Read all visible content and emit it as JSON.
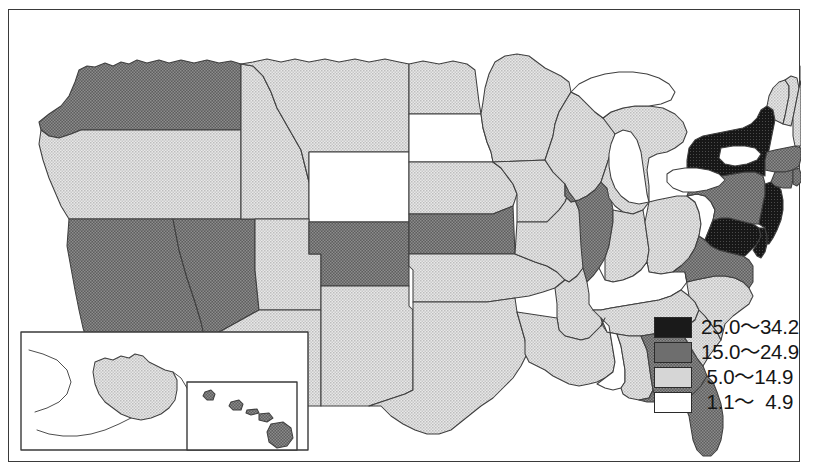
{
  "figure": {
    "type": "choropleth-map",
    "region": "United States"
  },
  "legend": {
    "title": "",
    "classes": [
      {
        "id": "class1",
        "label": "25.0〜34.2",
        "min": 25.0,
        "max": 34.2,
        "fill": "#1a1a1a",
        "swatch_name": "legend-swatch-darkest"
      },
      {
        "id": "class2",
        "label": "15.0〜24.9",
        "min": 15.0,
        "max": 24.9,
        "fill": "#6e6e6e",
        "swatch_name": "legend-swatch-dark"
      },
      {
        "id": "class3",
        "label": " 5.0〜14.9",
        "min": 5.0,
        "max": 14.9,
        "fill": "#d6d6d6",
        "swatch_name": "legend-swatch-light"
      },
      {
        "id": "class4",
        "label": " 1.1〜  4.9",
        "min": 1.1,
        "max": 4.9,
        "fill": "#ffffff",
        "swatch_name": "legend-swatch-lightest"
      }
    ]
  },
  "map": {
    "border_color": "#3a3a3a",
    "state_outline_color": "#3f3f3f",
    "water_fill": "#ffffff",
    "insets": [
      {
        "name": "alaska-inset",
        "class": "class3"
      },
      {
        "name": "hawaii-inset",
        "class": "class2"
      }
    ],
    "states": [
      {
        "code": "WA",
        "name": "Washington",
        "class": "class2"
      },
      {
        "code": "OR",
        "name": "Oregon",
        "class": "class3"
      },
      {
        "code": "CA",
        "name": "California",
        "class": "class2"
      },
      {
        "code": "NV",
        "name": "Nevada",
        "class": "class2"
      },
      {
        "code": "ID",
        "name": "Idaho",
        "class": "class3"
      },
      {
        "code": "MT",
        "name": "Montana",
        "class": "class3"
      },
      {
        "code": "WY",
        "name": "Wyoming",
        "class": "class4"
      },
      {
        "code": "UT",
        "name": "Utah",
        "class": "class3"
      },
      {
        "code": "AZ",
        "name": "Arizona",
        "class": "class3"
      },
      {
        "code": "CO",
        "name": "Colorado",
        "class": "class2"
      },
      {
        "code": "NM",
        "name": "New Mexico",
        "class": "class3"
      },
      {
        "code": "ND",
        "name": "North Dakota",
        "class": "class3"
      },
      {
        "code": "SD",
        "name": "South Dakota",
        "class": "class4"
      },
      {
        "code": "NE",
        "name": "Nebraska",
        "class": "class3"
      },
      {
        "code": "KS",
        "name": "Kansas",
        "class": "class2"
      },
      {
        "code": "OK",
        "name": "Oklahoma",
        "class": "class3"
      },
      {
        "code": "TX",
        "name": "Texas",
        "class": "class3"
      },
      {
        "code": "MN",
        "name": "Minnesota",
        "class": "class3"
      },
      {
        "code": "IA",
        "name": "Iowa",
        "class": "class3"
      },
      {
        "code": "MO",
        "name": "Missouri",
        "class": "class3"
      },
      {
        "code": "AR",
        "name": "Arkansas",
        "class": "class3"
      },
      {
        "code": "LA",
        "name": "Louisiana",
        "class": "class3"
      },
      {
        "code": "WI",
        "name": "Wisconsin",
        "class": "class3"
      },
      {
        "code": "IL",
        "name": "Illinois",
        "class": "class2"
      },
      {
        "code": "MI",
        "name": "Michigan",
        "class": "class3"
      },
      {
        "code": "IN",
        "name": "Indiana",
        "class": "class3"
      },
      {
        "code": "OH",
        "name": "Ohio",
        "class": "class3"
      },
      {
        "code": "KY",
        "name": "Kentucky",
        "class": "class4"
      },
      {
        "code": "TN",
        "name": "Tennessee",
        "class": "class3"
      },
      {
        "code": "MS",
        "name": "Mississippi",
        "class": "class4"
      },
      {
        "code": "AL",
        "name": "Alabama",
        "class": "class3"
      },
      {
        "code": "GA",
        "name": "Georgia",
        "class": "class2"
      },
      {
        "code": "FL",
        "name": "Florida",
        "class": "class2"
      },
      {
        "code": "SC",
        "name": "South Carolina",
        "class": "class3"
      },
      {
        "code": "NC",
        "name": "North Carolina",
        "class": "class3"
      },
      {
        "code": "VA",
        "name": "Virginia",
        "class": "class2"
      },
      {
        "code": "WV",
        "name": "West Virginia",
        "class": "class4"
      },
      {
        "code": "MD",
        "name": "Maryland",
        "class": "class1"
      },
      {
        "code": "DE",
        "name": "Delaware",
        "class": "class1"
      },
      {
        "code": "PA",
        "name": "Pennsylvania",
        "class": "class2"
      },
      {
        "code": "NJ",
        "name": "New Jersey",
        "class": "class1"
      },
      {
        "code": "NY",
        "name": "New York",
        "class": "class1"
      },
      {
        "code": "CT",
        "name": "Connecticut",
        "class": "class2"
      },
      {
        "code": "RI",
        "name": "Rhode Island",
        "class": "class2"
      },
      {
        "code": "MA",
        "name": "Massachusetts",
        "class": "class2"
      },
      {
        "code": "VT",
        "name": "Vermont",
        "class": "class3"
      },
      {
        "code": "NH",
        "name": "New Hampshire",
        "class": "class3"
      },
      {
        "code": "ME",
        "name": "Maine",
        "class": "class3"
      },
      {
        "code": "AK",
        "name": "Alaska",
        "class": "class3"
      },
      {
        "code": "HI",
        "name": "Hawaii",
        "class": "class2"
      }
    ]
  }
}
